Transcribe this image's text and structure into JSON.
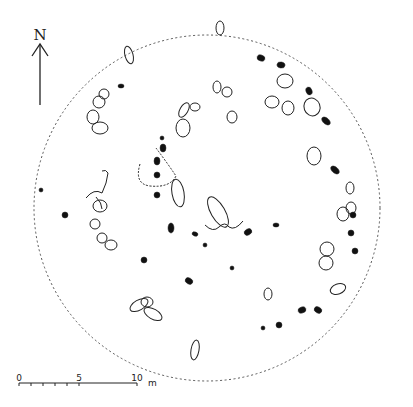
{
  "north": {
    "label": "N"
  },
  "scale": {
    "ticks": [
      "0",
      "5",
      "10"
    ],
    "unit": "m"
  },
  "colors": {
    "ink": "#222222",
    "fill": "#111111",
    "background": "#ffffff"
  },
  "boundary": {
    "cx": 207,
    "cy": 208,
    "r": 173
  },
  "stones_outline": [
    [
      129,
      55,
      4,
      9,
      -15
    ],
    [
      184,
      110,
      4,
      8,
      30
    ],
    [
      220,
      28,
      4,
      7,
      0
    ],
    [
      272,
      102,
      7,
      6,
      0
    ],
    [
      288,
      108,
      6,
      7,
      0
    ],
    [
      285,
      81,
      8,
      7,
      0
    ],
    [
      312,
      107,
      8,
      9,
      -20
    ],
    [
      314,
      156,
      7,
      9,
      0
    ],
    [
      183,
      128,
      7,
      9,
      0
    ],
    [
      232,
      117,
      5,
      6,
      0
    ],
    [
      217,
      87,
      4,
      6,
      0
    ],
    [
      227,
      92,
      5,
      5,
      0
    ],
    [
      195,
      107,
      5,
      4,
      0
    ],
    [
      350,
      188,
      4,
      6,
      0
    ],
    [
      351,
      208,
      5,
      6,
      0
    ],
    [
      343,
      214,
      6,
      7,
      0
    ],
    [
      327,
      249,
      7,
      7,
      0
    ],
    [
      326,
      263,
      7,
      7,
      0
    ],
    [
      139,
      305,
      10,
      5,
      -30
    ],
    [
      147,
      302,
      6,
      5,
      0
    ],
    [
      153,
      314,
      10,
      5,
      30
    ],
    [
      195,
      350,
      4,
      10,
      10
    ],
    [
      178,
      193,
      6,
      14,
      -10
    ],
    [
      218,
      212,
      7,
      17,
      -30
    ],
    [
      100,
      206,
      7,
      6,
      0
    ],
    [
      95,
      224,
      5,
      5,
      0
    ],
    [
      102,
      238,
      5,
      5,
      0
    ],
    [
      111,
      245,
      6,
      5,
      0
    ],
    [
      338,
      289,
      8,
      5,
      -20
    ],
    [
      268,
      294,
      4,
      6,
      0
    ],
    [
      93,
      117,
      6,
      7,
      0
    ],
    [
      99,
      102,
      6,
      6,
      0
    ],
    [
      104,
      94,
      5,
      5,
      0
    ],
    [
      100,
      128,
      8,
      6,
      0
    ]
  ],
  "stones_filled": [
    [
      121,
      86,
      3,
      2,
      0
    ],
    [
      261,
      58,
      4,
      3,
      20
    ],
    [
      281,
      65,
      4,
      3,
      10
    ],
    [
      309,
      91,
      3,
      4,
      -20
    ],
    [
      326,
      121,
      5,
      3,
      40
    ],
    [
      171,
      228,
      3,
      5,
      0
    ],
    [
      195,
      234,
      3,
      2,
      20
    ],
    [
      205,
      245,
      2,
      2,
      0
    ],
    [
      248,
      232,
      4,
      3,
      -30
    ],
    [
      276,
      225,
      3,
      2,
      0
    ],
    [
      232,
      268,
      2,
      2,
      0
    ],
    [
      335,
      170,
      5,
      3,
      40
    ],
    [
      351,
      233,
      3,
      3,
      0
    ],
    [
      353,
      215,
      3,
      3,
      0
    ],
    [
      355,
      251,
      3,
      3,
      0
    ],
    [
      302,
      310,
      4,
      3,
      -20
    ],
    [
      318,
      310,
      4,
      3,
      30
    ],
    [
      279,
      325,
      3,
      3,
      0
    ],
    [
      263,
      328,
      2,
      2,
      0
    ],
    [
      189,
      281,
      4,
      3,
      30
    ],
    [
      65,
      215,
      3,
      3,
      0
    ],
    [
      41,
      190,
      2,
      2,
      0
    ],
    [
      157,
      161,
      3,
      4,
      0
    ],
    [
      157,
      175,
      3,
      3,
      0
    ],
    [
      162,
      138,
      2,
      2,
      0
    ],
    [
      163,
      148,
      3,
      4,
      0
    ],
    [
      144,
      260,
      3,
      3,
      0
    ],
    [
      157,
      195,
      3,
      3,
      0
    ]
  ],
  "chart_data": {
    "type": "diagram",
    "north_arrow": "N",
    "scale_bar": {
      "ticks": [
        0,
        5,
        10
      ],
      "unit": "m"
    },
    "boundary": "dashed circle"
  }
}
